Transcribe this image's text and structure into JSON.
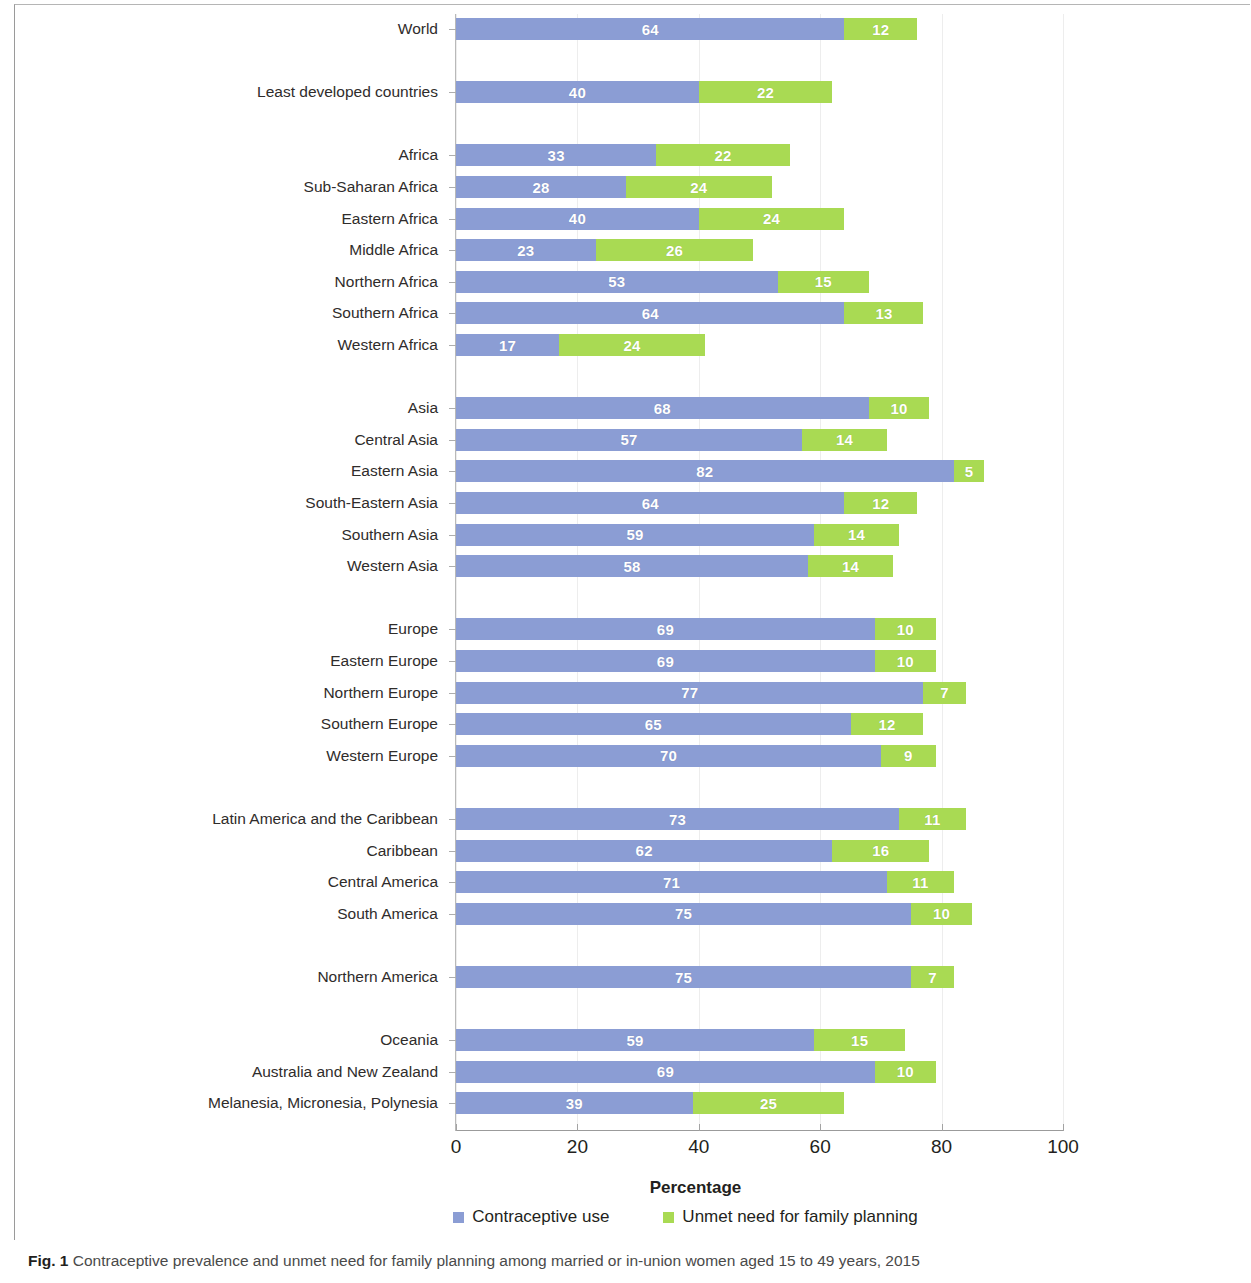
{
  "figure": {
    "caption_prefix": "Fig. 1",
    "caption_text": "Contraceptive prevalence and unmet need for family planning among married or in-union women aged 15 to 49 years, 2015",
    "axis_title": "Percentage"
  },
  "legend": {
    "items": [
      {
        "label": "Contraceptive use",
        "color": "#8b9dd4",
        "swatch": "blue-square-icon"
      },
      {
        "label": "Unmet need for family planning",
        "color": "#a9da53",
        "swatch": "green-square-icon"
      }
    ]
  },
  "chart_data": {
    "type": "bar",
    "orientation": "horizontal",
    "stacked": true,
    "title": "",
    "xlabel": "Percentage",
    "ylabel": "",
    "xlim": [
      0,
      100
    ],
    "xticks": [
      0,
      20,
      40,
      60,
      80,
      100
    ],
    "grid": true,
    "legend_position": "bottom",
    "categories": [
      "World",
      "Least developed countries",
      "Africa",
      "Sub-Saharan Africa",
      "Eastern Africa",
      "Middle Africa",
      "Northern Africa",
      "Southern Africa",
      "Western Africa",
      "Asia",
      "Central Asia",
      "Eastern Asia",
      "South-Eastern Asia",
      "Southern Asia",
      "Western Asia",
      "Europe",
      "Eastern Europe",
      "Northern Europe",
      "Southern Europe",
      "Western Europe",
      "Latin America and the Caribbean",
      "Caribbean",
      "Central America",
      "South America",
      "Northern America",
      "Oceania",
      "Australia and New Zealand",
      "Melanesia, Micronesia, Polynesia"
    ],
    "series": [
      {
        "name": "Contraceptive use",
        "color": "#8b9dd4",
        "values": [
          64,
          40,
          33,
          28,
          40,
          23,
          53,
          64,
          17,
          68,
          57,
          82,
          64,
          59,
          58,
          69,
          69,
          77,
          65,
          70,
          73,
          62,
          71,
          75,
          75,
          59,
          69,
          39
        ]
      },
      {
        "name": "Unmet need for family planning",
        "color": "#a9da53",
        "values": [
          12,
          22,
          22,
          24,
          24,
          26,
          15,
          13,
          24,
          10,
          14,
          5,
          12,
          14,
          14,
          10,
          10,
          7,
          12,
          9,
          11,
          16,
          11,
          10,
          7,
          15,
          10,
          25
        ]
      }
    ],
    "group_breaks_after": [
      0,
      1,
      8,
      14,
      19,
      23,
      24
    ]
  }
}
